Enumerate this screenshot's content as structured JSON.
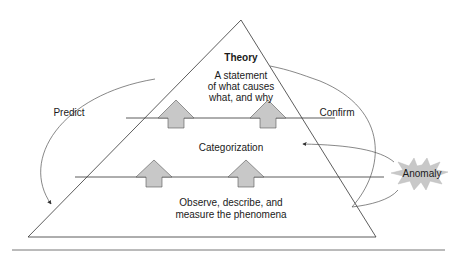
{
  "diagram": {
    "pyramid": {
      "levels": [
        {
          "id": "theory",
          "title": "Theory",
          "text_lines": [
            "A statement",
            "of what causes",
            "what, and why"
          ]
        },
        {
          "id": "categorization",
          "title": "Categorization"
        },
        {
          "id": "observation",
          "text_lines": [
            "Observe, describe, and",
            "measure the phenomena"
          ]
        }
      ]
    },
    "arrows": {
      "predict": "Predict",
      "confirm": "Confirm"
    },
    "anomaly": {
      "label": "Anomaly",
      "fill": "#c8c8c8"
    },
    "colors": {
      "line": "#333333",
      "up_arrow_fill": "#c8c8c8",
      "rule": "#777777"
    }
  }
}
